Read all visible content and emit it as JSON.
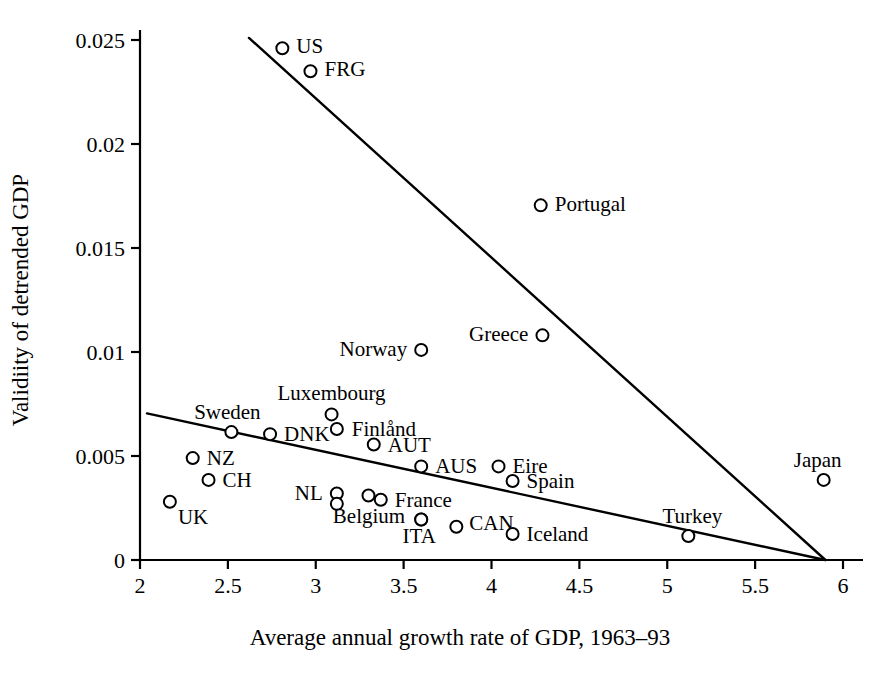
{
  "chart_data": {
    "type": "scatter",
    "title": "",
    "xlabel": "Average annual growth rate of GDP, 1963–93",
    "ylabel": "Validiity of detrended GDP",
    "xlim": [
      2,
      6
    ],
    "ylim": [
      0,
      0.0255
    ],
    "grid": false,
    "legend": "none",
    "xticks": [
      "2",
      "2.5",
      "3",
      "3.5",
      "4",
      "4.5",
      "5",
      "5.5",
      "6"
    ],
    "xtick_values": [
      2,
      2.5,
      3,
      3.5,
      4,
      4.5,
      5,
      5.5,
      6
    ],
    "yticks": [
      "0",
      "0.005",
      "0.01",
      "0.015",
      "0.02",
      "0.025"
    ],
    "ytick_values": [
      0,
      0.005,
      0.01,
      0.015,
      0.02,
      0.025
    ],
    "points": [
      {
        "label": "US",
        "x": 2.81,
        "y": 0.0246,
        "lx": 14,
        "ly": 5
      },
      {
        "label": "FRG",
        "x": 2.97,
        "y": 0.0235,
        "lx": 14,
        "ly": 5
      },
      {
        "label": "Portugal",
        "x": 4.28,
        "y": 0.01705,
        "lx": 14,
        "ly": 6
      },
      {
        "label": "Greece",
        "x": 4.29,
        "y": 0.0108,
        "lx": -14,
        "ly": 6,
        "anchor": "end"
      },
      {
        "label": "Norway",
        "x": 3.6,
        "y": 0.0101,
        "lx": -14,
        "ly": 6,
        "anchor": "end"
      },
      {
        "label": "Luxembourg",
        "x": 3.09,
        "y": 0.007,
        "lx": 0,
        "ly": -14,
        "anchor": "middle"
      },
      {
        "label": "DNK",
        "x": 2.74,
        "y": 0.00605,
        "lx": 14,
        "ly": 7
      },
      {
        "label": "Finlånd",
        "x": 3.12,
        "y": 0.0063,
        "lx": 15,
        "ly": 7
      },
      {
        "label": "Sweden",
        "x": 2.52,
        "y": 0.00615,
        "lx": -4,
        "ly": -13,
        "anchor": "middle"
      },
      {
        "label": "AUT",
        "x": 3.33,
        "y": 0.00555,
        "lx": 14,
        "ly": 7
      },
      {
        "label": "AUS",
        "x": 3.6,
        "y": 0.0045,
        "lx": 14,
        "ly": 7
      },
      {
        "label": "Eire",
        "x": 4.04,
        "y": 0.0045,
        "lx": 14,
        "ly": 7
      },
      {
        "label": "Spain",
        "x": 4.12,
        "y": 0.0038,
        "lx": 14,
        "ly": 7
      },
      {
        "label": "Japan",
        "x": 5.89,
        "y": 0.00385,
        "lx": -6,
        "ly": -13,
        "anchor": "middle"
      },
      {
        "label": "NZ",
        "x": 2.3,
        "y": 0.0049,
        "lx": 14,
        "ly": 7
      },
      {
        "label": "CH",
        "x": 2.39,
        "y": 0.00385,
        "lx": 14,
        "ly": 7
      },
      {
        "label": "UK",
        "x": 2.17,
        "y": 0.0028,
        "lx": 8,
        "ly": 22
      },
      {
        "label": "NL",
        "x": 3.12,
        "y": 0.0032,
        "lx": -14,
        "ly": 7,
        "anchor": "end"
      },
      {
        "label": "",
        "x": 3.12,
        "y": 0.0027
      },
      {
        "label": "",
        "x": 3.3,
        "y": 0.0031
      },
      {
        "label": "France",
        "x": 3.37,
        "y": 0.0029,
        "lx": 14,
        "ly": 7
      },
      {
        "label": "Belgium",
        "x": 3.6,
        "y": 0.00195,
        "lx": -16,
        "ly": 4,
        "anchor": "end"
      },
      {
        "label": "ITA",
        "x": 3.6,
        "y": 0.00195,
        "lx": -2,
        "ly": 24,
        "anchor": "middle"
      },
      {
        "label": "CAN",
        "x": 3.8,
        "y": 0.0016,
        "lx": 13,
        "ly": 3
      },
      {
        "label": "Iceland",
        "x": 4.12,
        "y": 0.00125,
        "lx": 14,
        "ly": 7
      },
      {
        "label": "Turkey",
        "x": 5.12,
        "y": 0.00115,
        "lx": 4,
        "ly": -13,
        "anchor": "middle"
      }
    ],
    "lines": [
      {
        "name": "steep-fit-line",
        "x1": 2.62,
        "y1": 0.0251,
        "x2": 5.9,
        "y2": 0.0
      },
      {
        "name": "shallow-fit-line",
        "x1": 2.04,
        "y1": 0.00705,
        "x2": 5.9,
        "y2": 0.0
      }
    ]
  }
}
